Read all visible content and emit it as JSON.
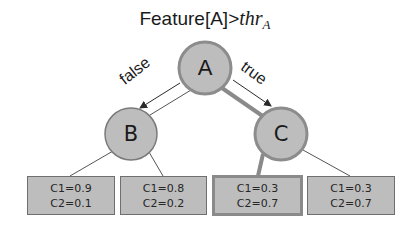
{
  "title": {
    "prefix": "Feature[A]>",
    "math": "thr",
    "subscript": "A"
  },
  "nodes": [
    {
      "id": "A",
      "label": "A",
      "cx": 205,
      "cy": 68,
      "r": 26,
      "on_path": true
    },
    {
      "id": "B",
      "label": "B",
      "cx": 131,
      "cy": 134,
      "r": 26,
      "on_path": false
    },
    {
      "id": "C",
      "label": "C",
      "cx": 281,
      "cy": 134,
      "r": 26,
      "on_path": true
    }
  ],
  "edges": [
    {
      "from": "A",
      "to": "B",
      "label": "false",
      "on_path": false
    },
    {
      "from": "A",
      "to": "C",
      "label": "true",
      "on_path": true
    }
  ],
  "leaves": [
    {
      "parent": "B",
      "c1": "C1=0.9",
      "c2": "C2=0.1",
      "on_path": false
    },
    {
      "parent": "B",
      "c1": "C1=0.8",
      "c2": "C2=0.2",
      "on_path": false
    },
    {
      "parent": "C",
      "c1": "C1=0.3",
      "c2": "C2=0.7",
      "on_path": true
    },
    {
      "parent": "C",
      "c1": "C1=0.3",
      "c2": "C2=0.7",
      "on_path": false
    }
  ],
  "colors": {
    "node_fill": "#bdbdbd",
    "node_border": "#8c8c8c",
    "path_highlight": "#8a8a8a",
    "edge_thin": "#3a3a3a",
    "leaf_fill": "#bdbdbd"
  }
}
